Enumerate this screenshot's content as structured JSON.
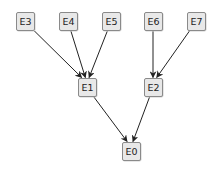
{
  "diagram": {
    "type": "tree",
    "nodes": [
      {
        "id": "E0",
        "label": "E0",
        "x": 131,
        "y": 151
      },
      {
        "id": "E1",
        "label": "E1",
        "x": 87,
        "y": 87
      },
      {
        "id": "E2",
        "label": "E2",
        "x": 153,
        "y": 87
      },
      {
        "id": "E3",
        "label": "E3",
        "x": 25,
        "y": 21
      },
      {
        "id": "E4",
        "label": "E4",
        "x": 68,
        "y": 21
      },
      {
        "id": "E5",
        "label": "E5",
        "x": 111,
        "y": 21
      },
      {
        "id": "E6",
        "label": "E6",
        "x": 153,
        "y": 21
      },
      {
        "id": "E7",
        "label": "E7",
        "x": 196,
        "y": 21
      }
    ],
    "edges": [
      {
        "from": "E3",
        "to": "E1"
      },
      {
        "from": "E4",
        "to": "E1"
      },
      {
        "from": "E5",
        "to": "E1"
      },
      {
        "from": "E6",
        "to": "E2"
      },
      {
        "from": "E7",
        "to": "E2"
      },
      {
        "from": "E1",
        "to": "E0"
      },
      {
        "from": "E2",
        "to": "E0"
      }
    ],
    "colors": {
      "node_fill": "#e8e8e8",
      "node_border": "#8a8a8a",
      "edge": "#222222"
    }
  }
}
